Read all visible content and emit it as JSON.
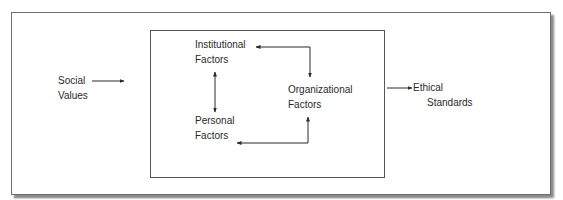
{
  "diagram": {
    "type": "flow",
    "nodes": {
      "social_values": {
        "line1": "Social",
        "line2": "Values"
      },
      "institutional": {
        "line1": "Institutional",
        "line2": "Factors"
      },
      "organizational": {
        "line1": "Organizational",
        "line2": "Factors"
      },
      "personal": {
        "line1": "Personal",
        "line2": "Factors"
      },
      "ethical_standards": {
        "line1": "Ethical",
        "line2": "Standards"
      }
    },
    "edges": [
      {
        "from": "Social Values",
        "to": "Factors box",
        "direction": "one-way"
      },
      {
        "from": "Institutional Factors",
        "to": "Organizational Factors",
        "direction": "two-way"
      },
      {
        "from": "Institutional Factors",
        "to": "Personal Factors",
        "direction": "two-way"
      },
      {
        "from": "Personal Factors",
        "to": "Organizational Factors",
        "direction": "two-way"
      },
      {
        "from": "Factors box",
        "to": "Ethical Standards",
        "direction": "one-way"
      }
    ],
    "colors": {
      "line": "#2a2a2a",
      "border": "#555555",
      "shadow": "#8a8a8a"
    }
  }
}
